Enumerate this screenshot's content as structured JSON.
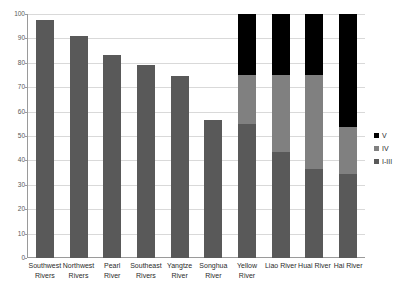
{
  "chart_data": {
    "type": "bar",
    "subtype": "stacked-bar",
    "title": "",
    "xlabel": "",
    "ylabel": "",
    "ylim": [
      0,
      100
    ],
    "yticks": [
      0,
      10,
      20,
      30,
      40,
      50,
      60,
      70,
      80,
      90,
      100
    ],
    "grid": true,
    "legend_position": "right",
    "categories": [
      "Southwest Rivers",
      "Northwest Rivers",
      "Pearl River",
      "Southeast Rivers",
      "Yangtze River",
      "Songhua River",
      "Yellow River",
      "Liao River",
      "Huai River",
      "Hai River"
    ],
    "category_lines": [
      [
        "Southwest",
        "Rivers"
      ],
      [
        "Northwest",
        "Rivers"
      ],
      [
        "Pearl River"
      ],
      [
        "Southeast",
        "Rivers"
      ],
      [
        "Yangtze",
        "River"
      ],
      [
        "Songhua",
        "River"
      ],
      [
        "Yellow",
        "River"
      ],
      [
        "Liao River"
      ],
      [
        "Huai River"
      ],
      [
        "Hai River"
      ]
    ],
    "series": [
      {
        "name": "I-III",
        "color": "#595959",
        "values": [
          97.5,
          91.0,
          83.0,
          79.0,
          74.5,
          56.5,
          55.0,
          43.5,
          36.5,
          34.5
        ]
      },
      {
        "name": "IV",
        "color": "#808080",
        "values": [
          0,
          0,
          0,
          0,
          0,
          0,
          20.0,
          31.5,
          38.5,
          19.0
        ]
      },
      {
        "name": "V",
        "color": "#000000",
        "values": [
          0,
          0,
          0,
          0,
          0,
          0,
          25.0,
          25.0,
          25.0,
          46.5
        ]
      }
    ],
    "legend_entries": [
      {
        "label": "V",
        "color": "#000000"
      },
      {
        "label": "IV",
        "color": "#808080"
      },
      {
        "label": "I-III",
        "color": "#595959"
      }
    ]
  },
  "colors": {
    "axis": "#9a9a9a",
    "grid": "#d9d9d9",
    "tick_text": "#595959",
    "label_text": "#2b2b2b",
    "background": "#ffffff"
  }
}
